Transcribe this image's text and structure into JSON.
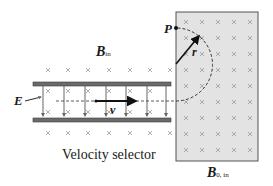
{
  "diagram": {
    "labels": {
      "B_in": {
        "main": "B",
        "sub": "in"
      },
      "B0_in": {
        "main": "B",
        "sub": "0, in"
      },
      "E": "E",
      "v": "v",
      "P": "P",
      "r": "r",
      "caption": "Velocity selector"
    },
    "colors": {
      "plate": "#6b6b6b",
      "plate_edge": "#3a3a3a",
      "field_region": "#e3e3e3",
      "field_border": "#555555",
      "cross": "#9a9a9a",
      "arrow": "#111111",
      "efield_line": "#666666"
    },
    "elements": {
      "velocity_selector": {
        "top_plate_y": 84,
        "bottom_plate_y": 120,
        "x_start": 33,
        "x_end": 171
      },
      "field_region": {
        "x": 176,
        "y": 12,
        "width": 82,
        "height": 149
      },
      "beam_y": 101,
      "point_P": {
        "x": 176,
        "y": 28
      },
      "semicircle_radius": 36.5
    }
  }
}
